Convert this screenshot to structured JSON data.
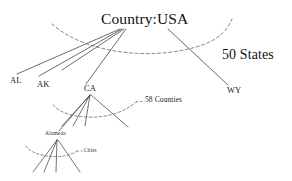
{
  "diagram": {
    "title": "Country:USA",
    "type": "hierarchy-tree",
    "background_color": "#ffffff",
    "line_color": "#3a3a3a",
    "dashed_color": "#555555",
    "nodes": {
      "root": {
        "label": "Country:USA",
        "level": "country"
      },
      "states": [
        {
          "label": "AL",
          "level": "state"
        },
        {
          "label": "AK",
          "level": "state"
        },
        {
          "label": "CA",
          "level": "state"
        },
        {
          "label": "WY",
          "level": "state"
        }
      ],
      "county": {
        "label": "Alameda",
        "level": "county"
      }
    },
    "annotations": [
      {
        "label": "50 States",
        "describes": "state-level-children"
      },
      {
        "label": "58 Counties",
        "describes": "california-county-children"
      },
      {
        "label": "Cities",
        "describes": "alameda-city-children"
      }
    ]
  }
}
